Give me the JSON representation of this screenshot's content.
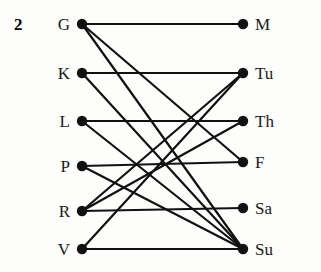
{
  "figure": {
    "index_label": "2",
    "type": "bipartite-graph",
    "width": 321,
    "height": 272,
    "background": "#fdfdfc",
    "edge_color": "#111111",
    "node_color": "#111111",
    "edge_width": 2.2,
    "node_radius": 5.2
  },
  "chart_data": {
    "type": "diagram",
    "title": "",
    "left_nodes": [
      {
        "id": "G",
        "label": "G",
        "x": 82,
        "y": 24
      },
      {
        "id": "K",
        "label": "K",
        "x": 82,
        "y": 73
      },
      {
        "id": "L",
        "label": "L",
        "x": 82,
        "y": 121
      },
      {
        "id": "P",
        "label": "P",
        "x": 82,
        "y": 166
      },
      {
        "id": "R",
        "label": "R",
        "x": 82,
        "y": 211
      },
      {
        "id": "V",
        "label": "V",
        "x": 82,
        "y": 249
      }
    ],
    "right_nodes": [
      {
        "id": "M",
        "label": "M",
        "x": 243,
        "y": 24
      },
      {
        "id": "Tu",
        "label": "Tu",
        "x": 243,
        "y": 73
      },
      {
        "id": "Th",
        "label": "Th",
        "x": 243,
        "y": 121
      },
      {
        "id": "F",
        "label": "F",
        "x": 243,
        "y": 162
      },
      {
        "id": "Sa",
        "label": "Sa",
        "x": 243,
        "y": 208
      },
      {
        "id": "Su",
        "label": "Su",
        "x": 243,
        "y": 249
      }
    ],
    "edges": [
      {
        "from": "G",
        "to": "M"
      },
      {
        "from": "G",
        "to": "F"
      },
      {
        "from": "G",
        "to": "Su"
      },
      {
        "from": "K",
        "to": "Tu"
      },
      {
        "from": "K",
        "to": "Su"
      },
      {
        "from": "L",
        "to": "Th"
      },
      {
        "from": "L",
        "to": "Su"
      },
      {
        "from": "P",
        "to": "F"
      },
      {
        "from": "P",
        "to": "Su"
      },
      {
        "from": "R",
        "to": "Tu"
      },
      {
        "from": "R",
        "to": "Th"
      },
      {
        "from": "R",
        "to": "Sa"
      },
      {
        "from": "V",
        "to": "Tu"
      },
      {
        "from": "V",
        "to": "Su"
      }
    ],
    "label_offsets": {
      "left_gap": 12,
      "right_gap": 12
    }
  }
}
